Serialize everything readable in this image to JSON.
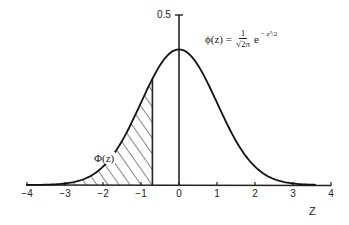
{
  "chart_data": {
    "type": "line",
    "title": "",
    "xlabel": "Z",
    "ylabel": "",
    "xlim": [
      -4,
      4
    ],
    "ylim": [
      0,
      0.5
    ],
    "x_ticks": [
      -4,
      -3,
      -2,
      -1,
      0,
      1,
      2,
      3,
      4
    ],
    "x_tick_labels": [
      "−4",
      "−3",
      "−2",
      "−1",
      "0",
      "1",
      "2",
      "3",
      "4"
    ],
    "y_ticks": [
      0.5
    ],
    "y_tick_labels": [
      "0.5"
    ],
    "grid": false,
    "legend": null,
    "series": [
      {
        "name": "φ(z)",
        "x": [
          -4,
          -3.5,
          -3,
          -2.5,
          -2,
          -1.5,
          -1,
          -0.5,
          0,
          0.5,
          1,
          1.5,
          2,
          2.5,
          3,
          3.5,
          4
        ],
        "values": [
          0.0001,
          0.0009,
          0.0044,
          0.0175,
          0.054,
          0.1295,
          0.242,
          0.3521,
          0.3989,
          0.3521,
          0.242,
          0.1295,
          0.054,
          0.0175,
          0.0044,
          0.0009,
          0.0001
        ]
      }
    ],
    "shaded_region": {
      "from": -4,
      "to": -0.7,
      "pattern": "diagonal-hatch",
      "label": "Φ(z)"
    },
    "annotations": [
      {
        "text": "φ(z) = 1/√(2π) · e^(−z²/2)",
        "position": "upper-right of peak"
      },
      {
        "text": "Φ(z)",
        "position": "inside shaded area"
      }
    ]
  },
  "labels": {
    "x_axis_title": "Z",
    "y_tick_top": "0.5",
    "ticks": [
      "−4",
      "−3",
      "−2",
      "−1",
      "0",
      "1",
      "2",
      "3",
      "4"
    ],
    "shaded_label": "Φ(z)",
    "formula_lhs": "ϕ(z) =",
    "formula_num": "1",
    "formula_den": "√2π",
    "formula_exp_base": "e",
    "formula_exp": "− z²/2"
  }
}
